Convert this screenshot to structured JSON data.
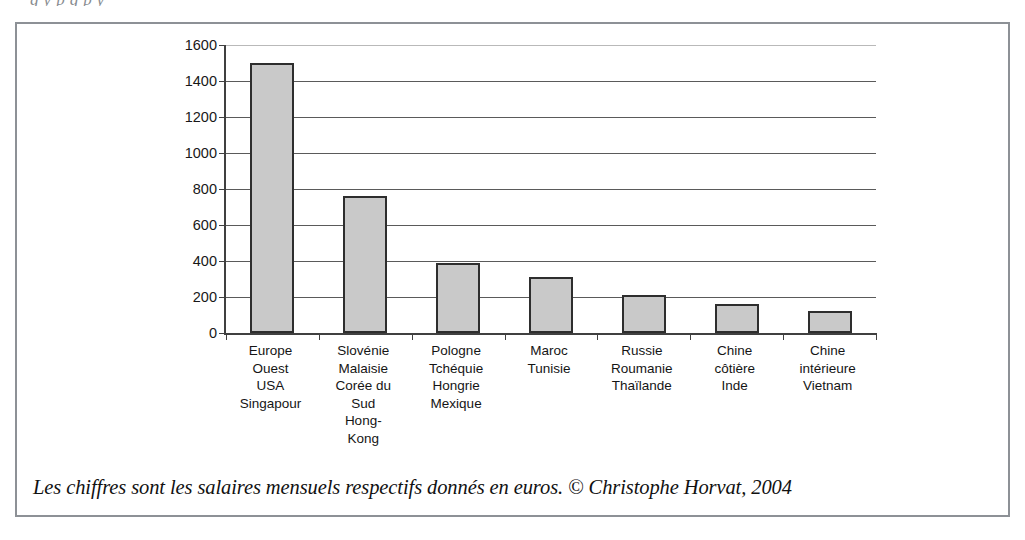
{
  "top_cut_text": "g                   y        p                                                      g       p   y",
  "caption": "Les chiffres sont les salaires mensuels respectifs donnés en euros. © Christophe Horvat, 2004",
  "colors": {
    "bar_fill": "#c9c9c9",
    "bar_border": "#2e2e2e",
    "gridline": "#5a5a5a",
    "axis": "#404040",
    "frame": "#8d9196",
    "text": "#151515",
    "background": "#ffffff"
  },
  "chart_data": {
    "type": "bar",
    "title": "",
    "subtitle": "",
    "xlabel": "",
    "ylabel": "",
    "ylim": [
      0,
      1600
    ],
    "ytick_step": 200,
    "yticks": [
      0,
      200,
      400,
      600,
      800,
      1000,
      1200,
      1400,
      1600
    ],
    "ytick_labels": [
      "0",
      "200",
      "400",
      "600",
      "800",
      "1000",
      "1200",
      "1400",
      "1600"
    ],
    "grid": true,
    "grid_axis": "y",
    "legend": false,
    "legend_position": "none",
    "units": "euros",
    "categories": [
      "Europe Ouest USA Singapour",
      "Slovénie Malaisie Corée du Sud Hong-Kong",
      "Pologne Tchéquie Hongrie Mexique",
      "Maroc Tunisie",
      "Russie Roumanie Thaïlande",
      "Chine côtière Inde",
      "Chine intérieure Vietnam"
    ],
    "category_lines": [
      [
        "Europe",
        "Ouest",
        "USA",
        "Singapour"
      ],
      [
        "Slovénie",
        "Malaisie",
        "Corée du",
        "Sud",
        "Hong-",
        "Kong"
      ],
      [
        "Pologne",
        "Tchéquie",
        "Hongrie",
        "Mexique"
      ],
      [
        "Maroc",
        "Tunisie"
      ],
      [
        "Russie",
        "Roumanie",
        "Thaïlande"
      ],
      [
        "Chine",
        "côtière",
        "Inde"
      ],
      [
        "Chine",
        "intérieure",
        "Vietnam"
      ]
    ],
    "values": [
      1500,
      760,
      390,
      310,
      210,
      160,
      120
    ]
  }
}
